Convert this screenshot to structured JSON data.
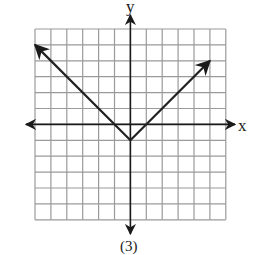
{
  "chart_data": {
    "type": "line",
    "title": "",
    "caption": "(3)",
    "xlabel": "x",
    "ylabel": "y",
    "xlim": [
      -6,
      6
    ],
    "ylim": [
      -6,
      6
    ],
    "grid": true,
    "grid_cells": 12,
    "function": "y = |x| - 1",
    "series": [
      {
        "name": "graph",
        "points": [
          [
            -6,
            5
          ],
          [
            0,
            -1
          ],
          [
            5,
            4
          ]
        ],
        "arrows": [
          "start",
          "end"
        ]
      }
    ],
    "colors": {
      "grid": "#9a9a9a",
      "axis": "#1a1a1a",
      "line": "#222222"
    }
  },
  "labels": {
    "x_axis": "x",
    "y_axis": "y",
    "caption": "(3)"
  }
}
